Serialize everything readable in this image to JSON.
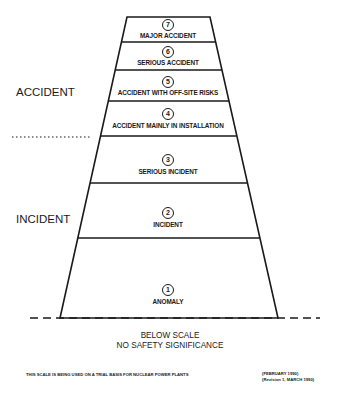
{
  "diagram": {
    "levels": [
      {
        "number": "7",
        "label": "MAJOR ACCIDENT"
      },
      {
        "number": "6",
        "label": "SERIOUS ACCIDENT"
      },
      {
        "number": "5",
        "label": "ACCIDENT WITH OFF-SITE RISKS"
      },
      {
        "number": "4",
        "label": "ACCIDENT MAINLY IN INSTALLATION"
      },
      {
        "number": "3",
        "label": "SERIOUS INCIDENT"
      },
      {
        "number": "2",
        "label": "INCIDENT"
      },
      {
        "number": "1",
        "label": "ANOMALY"
      }
    ],
    "categories": {
      "accident": "ACCIDENT",
      "incident": "INCIDENT"
    },
    "below_scale": {
      "line1": "BELOW SCALE",
      "line2": "NO SAFETY SIGNIFICANCE"
    },
    "footnote": "THIS SCALE IS BEING USED ON A TRIAL BASIS FOR NUCLEAR POWER PLANTS",
    "dates": {
      "line1": "(FEBRUARY 1990)",
      "line2": "(Revision 1, MARCH 1990)"
    },
    "colors": {
      "line": "#1a1a1a",
      "background": "#ffffff"
    }
  }
}
